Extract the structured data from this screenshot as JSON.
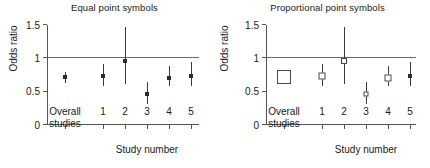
{
  "figure": {
    "axis_title_y": "Odds ratio",
    "axis_title_x": "Study number",
    "y_ticks": [
      "0",
      "0.5",
      "1",
      "1.5"
    ],
    "x_categories": [
      "Overall studies",
      "1",
      "2",
      "3",
      "4",
      "5"
    ],
    "overall_label_line1": "Overall",
    "overall_label_line2": "studies"
  },
  "panels": {
    "left": {
      "title": "Equal point symbols"
    },
    "right": {
      "title": "Proportional point symbols"
    }
  },
  "chart_data": [
    {
      "type": "scatter",
      "title": "Equal point symbols",
      "xlabel": "Study number",
      "ylabel": "Odds ratio",
      "ylim": [
        0,
        1.5
      ],
      "yticks": [
        0,
        0.5,
        1,
        1.5
      ],
      "grid": false,
      "legend": "none",
      "reference_line": 1,
      "marker_style": "equal-size-filled-square",
      "categories": [
        "Overall studies",
        "1",
        "2",
        "3",
        "4",
        "5"
      ],
      "values": [
        0.72,
        0.74,
        0.96,
        0.46,
        0.71,
        0.74
      ],
      "ci_low": [
        0.63,
        0.58,
        0.61,
        0.32,
        0.58,
        0.58
      ],
      "ci_high": [
        0.8,
        0.92,
        1.47,
        0.64,
        0.88,
        0.94
      ],
      "marker_sizes": [
        4,
        4,
        4,
        4,
        4,
        4
      ]
    },
    {
      "type": "scatter",
      "title": "Proportional point symbols",
      "xlabel": "Study number",
      "ylabel": "Odds ratio",
      "ylim": [
        0,
        1.5
      ],
      "yticks": [
        0,
        0.5,
        1,
        1.5
      ],
      "grid": false,
      "legend": "none",
      "reference_line": 1,
      "marker_style": "weight-proportional-open-square",
      "categories": [
        "Overall studies",
        "1",
        "2",
        "3",
        "4",
        "5"
      ],
      "values": [
        0.72,
        0.74,
        0.96,
        0.46,
        0.71,
        0.74
      ],
      "ci_low": [
        0.63,
        0.58,
        0.61,
        0.32,
        0.58,
        0.58
      ],
      "ci_high": [
        0.8,
        0.92,
        1.47,
        0.64,
        0.88,
        0.94
      ],
      "marker_sizes": [
        14,
        7,
        6,
        5,
        7,
        4
      ]
    }
  ]
}
